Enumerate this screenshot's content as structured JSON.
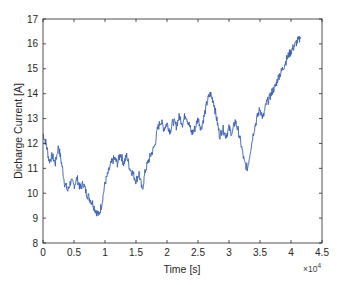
{
  "chart_data": {
    "type": "line",
    "title": "",
    "xlabel": "Time [s]",
    "ylabel": "Dicharge Current [A]",
    "x_exponent_label": "×10",
    "x_exponent_power": "4",
    "xlim": [
      0,
      45000
    ],
    "ylim": [
      8,
      17
    ],
    "xticks": [
      0,
      5000,
      10000,
      15000,
      20000,
      25000,
      30000,
      35000,
      40000,
      45000
    ],
    "xtick_labels": [
      "0",
      "0.5",
      "1",
      "1.5",
      "2",
      "2.5",
      "3",
      "3.5",
      "4",
      "4.5"
    ],
    "yticks": [
      8,
      9,
      10,
      11,
      12,
      13,
      14,
      15,
      16,
      17
    ],
    "ytick_labels": [
      "8",
      "9",
      "10",
      "11",
      "12",
      "13",
      "14",
      "15",
      "16",
      "17"
    ],
    "grid": false,
    "legend": null,
    "line_color": "#3a5fb0",
    "series": [
      {
        "name": "Discharge Current",
        "x": [
          0,
          500,
          1000,
          1500,
          2000,
          2500,
          3000,
          3500,
          4000,
          4500,
          5000,
          5500,
          6000,
          6500,
          7000,
          7500,
          8000,
          8500,
          9000,
          9500,
          10000,
          10500,
          11000,
          11500,
          12000,
          12500,
          13000,
          13500,
          14000,
          14500,
          15000,
          15500,
          16000,
          16500,
          17000,
          17500,
          18000,
          18500,
          19000,
          19500,
          20000,
          20500,
          21000,
          21500,
          22000,
          22500,
          23000,
          23500,
          24000,
          24500,
          25000,
          25500,
          26000,
          26500,
          27000,
          27500,
          28000,
          28500,
          29000,
          29500,
          30000,
          30500,
          31000,
          31500,
          32000,
          32500,
          33000,
          33500,
          34000,
          34500,
          35000,
          35500,
          36000,
          36500,
          37000,
          37500,
          38000,
          38500,
          39000,
          39500,
          40000,
          40500,
          41000,
          41500
        ],
        "values": [
          12.4,
          12.0,
          11.3,
          11.5,
          11.2,
          11.9,
          11.2,
          10.4,
          10.1,
          10.5,
          10.3,
          10.6,
          10.2,
          10.4,
          10.0,
          9.8,
          9.6,
          9.3,
          9.1,
          9.6,
          10.4,
          10.8,
          11.2,
          11.4,
          11.2,
          11.6,
          11.2,
          11.5,
          11.0,
          10.8,
          10.5,
          10.8,
          10.1,
          10.9,
          11.3,
          11.6,
          11.9,
          12.6,
          12.9,
          12.6,
          12.8,
          12.5,
          12.9,
          12.7,
          13.1,
          12.8,
          13.2,
          12.8,
          12.4,
          12.6,
          13.0,
          12.6,
          13.1,
          13.7,
          14.0,
          13.7,
          13.0,
          12.3,
          12.6,
          12.3,
          12.6,
          12.4,
          12.9,
          12.5,
          11.9,
          11.2,
          11.0,
          11.8,
          12.5,
          13.0,
          13.4,
          13.0,
          13.6,
          13.8,
          14.1,
          14.3,
          14.7,
          14.9,
          15.2,
          15.5,
          15.7,
          15.9,
          16.1,
          16.2
        ]
      }
    ]
  }
}
